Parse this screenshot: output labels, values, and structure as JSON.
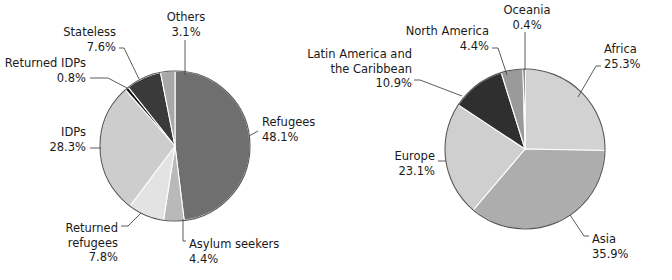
{
  "charts": [
    {
      "name": "population-of-concern-by-category",
      "center": {
        "x": 175,
        "y": 146
      },
      "radius": 75,
      "chart_data": {
        "type": "pie",
        "title": "",
        "labels": [
          "Refugees",
          "Asylum seekers",
          "Returned refugees",
          "IDPs",
          "Returned IDPs",
          "Stateless",
          "Others"
        ],
        "values": [
          48.1,
          4.4,
          7.8,
          28.3,
          0.8,
          7.6,
          3.1
        ],
        "value_suffix": "%",
        "colors": [
          "#6f6f6f",
          "#b9b9b9",
          "#e3e3e3",
          "#cdcdcd",
          "#121212",
          "#3a3a3a",
          "#a8a8a8"
        ],
        "start_angle_deg": 0,
        "direction": "clockwise",
        "legend": "callout-labels"
      },
      "slices": [
        {
          "label": "Refugees",
          "value": "48.1%",
          "color": "#6f6f6f",
          "label_x": 262,
          "label_y": 126,
          "anchor": "start",
          "leader": "M 249,136 L 258,131"
        },
        {
          "label": "Asylum seekers",
          "value": "4.4%",
          "color": "#b9b9b9",
          "label_x": 189,
          "label_y": 248,
          "anchor": "start",
          "leader": "M 183,219 L 183,241 L 186,241"
        },
        {
          "label": "Returned refugees",
          "value": "7.8%",
          "color": "#e3e3e3",
          "label_x": 118,
          "label_y": 232,
          "anchor": "end",
          "leader": "M 141,213 L 128,226 L 121,226"
        },
        {
          "label": "IDPs",
          "value": "28.3%",
          "color": "#cdcdcd",
          "label_x": 86,
          "label_y": 136,
          "anchor": "end",
          "leader": "M 101,148 L 90,148"
        },
        {
          "label": "Returned IDPs",
          "value": "0.8%",
          "color": "#121212",
          "label_x": 86,
          "label_y": 67,
          "anchor": "end",
          "leader": "M 127,88 L 108,78 L 90,78"
        },
        {
          "label": "Stateless",
          "value": "7.6%",
          "color": "#3a3a3a",
          "label_x": 116,
          "label_y": 36,
          "anchor": "end",
          "leader": "M 139,79 L 124,48 L 119,48"
        },
        {
          "label": "Others",
          "value": "3.1%",
          "color": "#a8a8a8",
          "label_x": 186,
          "label_y": 21,
          "anchor": "middle",
          "leader": "M 185,75 L 185,40"
        }
      ]
    },
    {
      "name": "population-of-concern-by-region",
      "center": {
        "x": 525,
        "y": 149
      },
      "radius": 80,
      "chart_data": {
        "type": "pie",
        "title": "",
        "labels": [
          "Africa",
          "Asia",
          "Europe",
          "Latin America and the Caribbean",
          "North America",
          "Oceania"
        ],
        "values": [
          25.3,
          35.9,
          23.1,
          10.9,
          4.4,
          0.4
        ],
        "value_suffix": "%",
        "colors": [
          "#d2d2d2",
          "#adadad",
          "#cfcfcf",
          "#2f2f2f",
          "#9a9a9a",
          "#101010"
        ],
        "start_angle_deg": 0,
        "direction": "clockwise",
        "legend": "callout-labels"
      },
      "slices": [
        {
          "label": "Africa",
          "value": "25.3%",
          "color": "#d2d2d2",
          "label_x": 604,
          "label_y": 53,
          "anchor": "start",
          "leader": "M 578,97 L 596,66 L 601,66"
        },
        {
          "label": "Asia",
          "value": "35.9%",
          "color": "#adadad",
          "label_x": 592,
          "label_y": 243,
          "anchor": "start",
          "leader": "M 570,215 L 584,236 L 589,236"
        },
        {
          "label": "Europe",
          "value": "23.1%",
          "color": "#cfcfcf",
          "label_x": 435,
          "label_y": 160,
          "anchor": "end",
          "leader": "M 446,161 L 438,161"
        },
        {
          "label": "Latin America and the Caribbean",
          "value": "10.9%",
          "color": "#2f2f2f",
          "label_x": 412,
          "label_y": 58,
          "anchor": "end",
          "leader": "M 462,96 L 420,80 L 414,80"
        },
        {
          "label": "North America",
          "value": "4.4%",
          "color": "#9a9a9a",
          "label_x": 489,
          "label_y": 35,
          "anchor": "end",
          "leader": "M 507,75 L 498,48 L 492,48"
        },
        {
          "label": "Oceania",
          "value": "0.4%",
          "color": "#101010",
          "label_x": 527,
          "label_y": 14,
          "anchor": "middle",
          "leader": "M 525,70 L 525,32"
        }
      ]
    }
  ]
}
